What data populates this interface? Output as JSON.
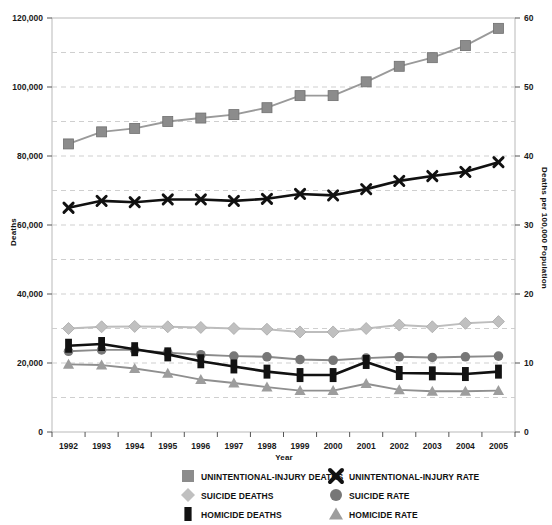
{
  "chart_data": {
    "type": "line",
    "title": "",
    "xlabel": "Year",
    "ylabel": "Deaths",
    "y2label": "Deaths per 100,000 Population",
    "x": [
      1992,
      1993,
      1994,
      1995,
      1996,
      1997,
      1998,
      1999,
      2000,
      2001,
      2002,
      2003,
      2004,
      2005
    ],
    "categories": [
      "1992",
      "1993",
      "1994",
      "1995",
      "1996",
      "1997",
      "1998",
      "1999",
      "2000",
      "2001",
      "2002",
      "2003",
      "2004",
      "2005"
    ],
    "ylim": [
      0,
      120000
    ],
    "y2lim": [
      0,
      60
    ],
    "yticks": [
      0,
      20000,
      40000,
      60000,
      80000,
      100000,
      120000
    ],
    "ytick_labels": [
      "0",
      "20,000",
      "40,000",
      "60,000",
      "80,000",
      "100,000",
      "120,000"
    ],
    "y_gridlines": [
      10000,
      30000,
      50000,
      70000,
      90000,
      110000
    ],
    "y2ticks": [
      0,
      10,
      20,
      30,
      40,
      50,
      60
    ],
    "y2tick_labels": [
      "0",
      "10",
      "20",
      "30",
      "40",
      "50",
      "60"
    ],
    "grid": true,
    "legend_position": "bottom",
    "series": [
      {
        "name": "UNINTENTIONAL-INJURY DEATHS",
        "axis": "left",
        "marker": "square",
        "color": "#8c8c8c",
        "line_color": "#9a9a9a",
        "values": [
          83500,
          87000,
          88000,
          90000,
          91000,
          92000,
          94000,
          97500,
          97500,
          101500,
          106000,
          108500,
          112000,
          117000
        ]
      },
      {
        "name": "SUICIDE DEATHS",
        "axis": "left",
        "marker": "diamond",
        "color": "#c0c0c0",
        "line_color": "#bdbdbd",
        "values": [
          30000,
          30500,
          30600,
          30500,
          30300,
          30000,
          29800,
          29000,
          29000,
          30000,
          31000,
          30500,
          31500,
          32000
        ]
      },
      {
        "name": "HOMICIDE DEATHS",
        "axis": "left",
        "marker": "bar",
        "color": "#121212",
        "line_color": "#111111",
        "values": [
          25000,
          25500,
          24000,
          22500,
          20500,
          19000,
          17500,
          16500,
          16500,
          20300,
          17100,
          17000,
          16800,
          17500
        ]
      },
      {
        "name": "UNINTENTIONAL-INJURY RATE",
        "axis": "right",
        "marker": "x",
        "color": "#111111",
        "line_color": "#111111",
        "values": [
          32.5,
          33.5,
          33.3,
          33.7,
          33.7,
          33.5,
          33.8,
          34.5,
          34.3,
          35.2,
          36.4,
          37.1,
          37.7,
          39.1
        ]
      },
      {
        "name": "SUICIDE RATE",
        "axis": "right",
        "marker": "circle",
        "color": "#777777",
        "line_color": "#8a8a8a",
        "values": [
          11.7,
          11.9,
          11.9,
          11.5,
          11.2,
          11.0,
          10.9,
          10.5,
          10.4,
          10.7,
          10.9,
          10.8,
          10.9,
          11.0
        ]
      },
      {
        "name": "HOMICIDE RATE",
        "axis": "right",
        "marker": "triangle",
        "color": "#9d9d9d",
        "line_color": "#8f8f8f",
        "values": [
          9.8,
          9.7,
          9.2,
          8.5,
          7.6,
          7.1,
          6.5,
          6.0,
          6.0,
          7.0,
          6.1,
          5.9,
          5.9,
          6.0
        ]
      }
    ]
  },
  "legend": {
    "items": [
      {
        "label": "UNINTENTIONAL-INJURY DEATHS",
        "marker": "square",
        "color": "#8c8c8c",
        "col": 0,
        "row": 0
      },
      {
        "label": "SUICIDE DEATHS",
        "marker": "diamond",
        "color": "#c0c0c0",
        "col": 0,
        "row": 1
      },
      {
        "label": "HOMICIDE DEATHS",
        "marker": "bar",
        "color": "#121212",
        "col": 0,
        "row": 2
      },
      {
        "label": "UNINTENTIONAL-INJURY RATE",
        "marker": "x",
        "color": "#111111",
        "col": 1,
        "row": 0
      },
      {
        "label": "SUICIDE RATE",
        "marker": "circle",
        "color": "#777777",
        "col": 1,
        "row": 1
      },
      {
        "label": "HOMICIDE RATE",
        "marker": "triangle",
        "color": "#9d9d9d",
        "col": 1,
        "row": 2
      }
    ]
  },
  "colors": {
    "plot_border": "#b9b9b9",
    "gridline": "#c9c9c9",
    "axis_text": "#1a1a1a",
    "background": "#ffffff"
  }
}
